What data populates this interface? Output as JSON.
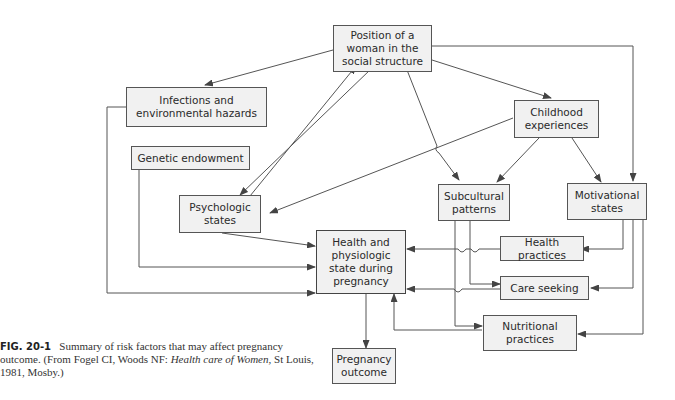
{
  "nodes": {
    "position": "Position of a\nwoman in the\nsocial structure",
    "infections": "Infections and\nenvironmental hazards",
    "childhood": "Childhood\nexperiences",
    "genetic": "Genetic endowment",
    "psychologic": "Psychologic\nstates",
    "subcultural": "Subcultural\npatterns",
    "motivational": "Motivational\nstates",
    "health_state": "Health and\nphysiologic\nstate during\npregnancy",
    "health_practices": "Health practices",
    "care_seeking": "Care seeking",
    "nutritional": "Nutritional\npractices",
    "outcome": "Pregnancy\noutcome"
  },
  "caption": {
    "figure_label": "FIG. 20-1",
    "text_1": "Summary of risk factors that may affect pregnancy outcome. (From Fogel CI, Woods NF: ",
    "source_title": "Health care of Women,",
    "text_2": " St Louis, 1981, Mosby.)"
  },
  "colors": {
    "box_fill": "#f1f1f1",
    "line": "#555555"
  }
}
